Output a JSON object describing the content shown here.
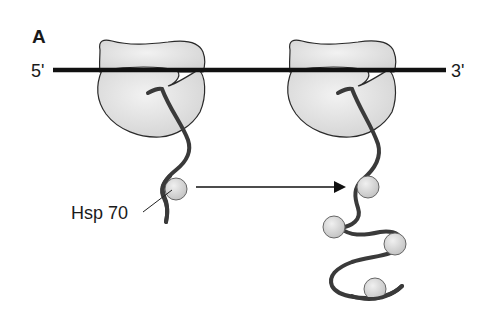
{
  "figure": {
    "panel_label": "A",
    "mrna": {
      "five_prime_label": "5'",
      "three_prime_label": "3'"
    },
    "chaperone_label": "Hsp 70",
    "colors": {
      "ink": "#1a1a1a",
      "chain": "#3a3a3a",
      "ribosome_fill": "#e2e2e2",
      "ribosome_stroke": "#2a2a2a",
      "hsp_fill": "#d8d8d8",
      "hsp_stroke": "#555555"
    },
    "ribosomes": [
      {
        "name": "ribosome-left",
        "hsp70_count": 1
      },
      {
        "name": "ribosome-right",
        "hsp70_count": 4
      }
    ],
    "arrow": {
      "direction": "right",
      "meaning": "nascent chain elongation with more Hsp 70 bound"
    }
  }
}
